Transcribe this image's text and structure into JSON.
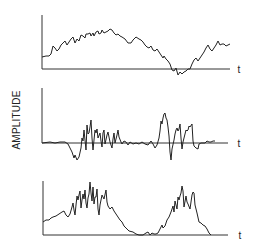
{
  "chart_data": [
    {
      "type": "line",
      "panel": 1,
      "title": "",
      "xlabel": "t",
      "ylabel": "AMPLITUDE",
      "grid": false,
      "description": "Raw signal: slowly varying noisy waveform, rises to a broad hump then dips below baseline and rises again before decaying",
      "frame": {
        "x0": 42,
        "y_top": 15,
        "y_base": 69,
        "x_end": 230
      },
      "points": [
        [
          42,
          57
        ],
        [
          46,
          56
        ],
        [
          49,
          56
        ],
        [
          51,
          54
        ],
        [
          53,
          46
        ],
        [
          55,
          48
        ],
        [
          57,
          51
        ],
        [
          59,
          49
        ],
        [
          61,
          45
        ],
        [
          63,
          43
        ],
        [
          65,
          41
        ],
        [
          67,
          45
        ],
        [
          69,
          42
        ],
        [
          71,
          39
        ],
        [
          73,
          37
        ],
        [
          75,
          43
        ],
        [
          77,
          39
        ],
        [
          79,
          41
        ],
        [
          81,
          35
        ],
        [
          83,
          36
        ],
        [
          85,
          38
        ],
        [
          86,
          34
        ],
        [
          88,
          34
        ],
        [
          90,
          33
        ],
        [
          91,
          36
        ],
        [
          93,
          33
        ],
        [
          94,
          36
        ],
        [
          96,
          32
        ],
        [
          98,
          31
        ],
        [
          99,
          34
        ],
        [
          101,
          33
        ],
        [
          102,
          30
        ],
        [
          104,
          33
        ],
        [
          106,
          32
        ],
        [
          108,
          31
        ],
        [
          110,
          29
        ],
        [
          112,
          30
        ],
        [
          114,
          33
        ],
        [
          116,
          35
        ],
        [
          118,
          34
        ],
        [
          120,
          36
        ],
        [
          122,
          37
        ],
        [
          125,
          39
        ],
        [
          128,
          43
        ],
        [
          131,
          43
        ],
        [
          133,
          40
        ],
        [
          136,
          37
        ],
        [
          139,
          39
        ],
        [
          141,
          40
        ],
        [
          143,
          42
        ],
        [
          145,
          45
        ],
        [
          147,
          47
        ],
        [
          149,
          48
        ],
        [
          151,
          46
        ],
        [
          153,
          50
        ],
        [
          155,
          51
        ],
        [
          157,
          49
        ],
        [
          159,
          52
        ],
        [
          161,
          55
        ],
        [
          163,
          58
        ],
        [
          164,
          56
        ],
        [
          166,
          59
        ],
        [
          168,
          61
        ],
        [
          170,
          64
        ],
        [
          172,
          70
        ],
        [
          174,
          71
        ],
        [
          176,
          68
        ],
        [
          178,
          75
        ],
        [
          180,
          72
        ],
        [
          182,
          74
        ],
        [
          184,
          72
        ],
        [
          186,
          71
        ],
        [
          188,
          69
        ],
        [
          190,
          69
        ],
        [
          192,
          64
        ],
        [
          194,
          60
        ],
        [
          196,
          58
        ],
        [
          198,
          61
        ],
        [
          200,
          58
        ],
        [
          202,
          55
        ],
        [
          204,
          52
        ],
        [
          206,
          48
        ],
        [
          208,
          45
        ],
        [
          210,
          49
        ],
        [
          212,
          51
        ],
        [
          214,
          48
        ],
        [
          216,
          45
        ],
        [
          218,
          41
        ],
        [
          220,
          45
        ],
        [
          222,
          44
        ],
        [
          224,
          44
        ],
        [
          226,
          46
        ],
        [
          228,
          45
        ],
        [
          230,
          44
        ]
      ],
      "t_label_pos": [
        239,
        69
      ]
    },
    {
      "type": "line",
      "panel": 2,
      "title": "",
      "xlabel": "t",
      "ylabel": "AMPLITUDE",
      "grid": false,
      "description": "Bipolar oscillating signal around zero baseline with two bursts of activity",
      "frame": {
        "x0": 42,
        "y_top": 88,
        "y_base": 143,
        "x_end": 228
      },
      "points": [
        [
          42,
          143
        ],
        [
          50,
          142
        ],
        [
          55,
          143
        ],
        [
          60,
          142
        ],
        [
          65,
          142
        ],
        [
          68,
          144
        ],
        [
          70,
          148
        ],
        [
          72,
          152
        ],
        [
          74,
          158
        ],
        [
          75,
          155
        ],
        [
          77,
          160
        ],
        [
          79,
          157
        ],
        [
          81,
          148
        ],
        [
          82,
          138
        ],
        [
          83,
          141
        ],
        [
          84,
          130
        ],
        [
          86,
          150
        ],
        [
          87,
          125
        ],
        [
          88,
          134
        ],
        [
          89,
          133
        ],
        [
          90,
          127
        ],
        [
          91,
          120
        ],
        [
          92,
          138
        ],
        [
          93,
          150
        ],
        [
          94,
          140
        ],
        [
          95,
          130
        ],
        [
          96,
          133
        ],
        [
          97,
          129
        ],
        [
          98,
          138
        ],
        [
          100,
          133
        ],
        [
          101,
          141
        ],
        [
          102,
          147
        ],
        [
          103,
          133
        ],
        [
          104,
          130
        ],
        [
          105,
          144
        ],
        [
          107,
          135
        ],
        [
          108,
          132
        ],
        [
          110,
          142
        ],
        [
          112,
          148
        ],
        [
          113,
          139
        ],
        [
          114,
          133
        ],
        [
          115,
          143
        ],
        [
          117,
          135
        ],
        [
          118,
          130
        ],
        [
          119,
          137
        ],
        [
          121,
          142
        ],
        [
          122,
          144
        ],
        [
          124,
          141
        ],
        [
          126,
          142
        ],
        [
          128,
          145
        ],
        [
          130,
          142
        ],
        [
          133,
          144
        ],
        [
          136,
          143
        ],
        [
          139,
          144
        ],
        [
          142,
          142
        ],
        [
          145,
          144
        ],
        [
          148,
          145
        ],
        [
          151,
          141
        ],
        [
          153,
          144
        ],
        [
          155,
          148
        ],
        [
          157,
          145
        ],
        [
          159,
          138
        ],
        [
          160,
          131
        ],
        [
          161,
          121
        ],
        [
          162,
          124
        ],
        [
          163,
          118
        ],
        [
          164,
          114
        ],
        [
          165,
          113
        ],
        [
          166,
          118
        ],
        [
          167,
          120
        ],
        [
          168,
          127
        ],
        [
          169,
          136
        ],
        [
          170,
          152
        ],
        [
          171,
          160
        ],
        [
          172,
          149
        ],
        [
          174,
          140
        ],
        [
          175,
          134
        ],
        [
          176,
          130
        ],
        [
          177,
          128
        ],
        [
          178,
          131
        ],
        [
          179,
          129
        ],
        [
          180,
          124
        ],
        [
          181,
          138
        ],
        [
          182,
          149
        ],
        [
          183,
          142
        ],
        [
          184,
          138
        ],
        [
          185,
          134
        ],
        [
          186,
          130
        ],
        [
          187,
          131
        ],
        [
          188,
          130
        ],
        [
          189,
          126
        ],
        [
          190,
          127
        ],
        [
          192,
          124
        ],
        [
          193,
          141
        ],
        [
          194,
          146
        ],
        [
          196,
          148
        ],
        [
          198,
          149
        ],
        [
          199,
          144
        ],
        [
          201,
          143
        ],
        [
          203,
          143
        ],
        [
          205,
          143
        ],
        [
          207,
          141
        ],
        [
          209,
          142
        ],
        [
          211,
          142
        ],
        [
          213,
          141
        ],
        [
          215,
          141
        ]
      ],
      "t_label_pos": [
        239,
        143
      ]
    },
    {
      "type": "line",
      "panel": 3,
      "title": "",
      "xlabel": "t",
      "ylabel": "AMPLITUDE",
      "grid": false,
      "description": "Rectified/envelope signal: always above baseline, two bursts of high amplitude",
      "frame": {
        "x0": 43,
        "y_top": 181,
        "y_base": 235,
        "x_end": 228
      },
      "points": [
        [
          43,
          222
        ],
        [
          46,
          220
        ],
        [
          49,
          220
        ],
        [
          51,
          218
        ],
        [
          53,
          217
        ],
        [
          56,
          216
        ],
        [
          59,
          214
        ],
        [
          62,
          212
        ],
        [
          64,
          211
        ],
        [
          66,
          215
        ],
        [
          68,
          217
        ],
        [
          70,
          214
        ],
        [
          72,
          207
        ],
        [
          73,
          203
        ],
        [
          74,
          210
        ],
        [
          75,
          215
        ],
        [
          76,
          205
        ],
        [
          77,
          196
        ],
        [
          78,
          200
        ],
        [
          79,
          195
        ],
        [
          80,
          191
        ],
        [
          81,
          208
        ],
        [
          82,
          200
        ],
        [
          83,
          194
        ],
        [
          84,
          199
        ],
        [
          85,
          190
        ],
        [
          86,
          203
        ],
        [
          87,
          208
        ],
        [
          88,
          198
        ],
        [
          89,
          194
        ],
        [
          90,
          182
        ],
        [
          91,
          193
        ],
        [
          92,
          201
        ],
        [
          93,
          187
        ],
        [
          94,
          204
        ],
        [
          95,
          197
        ],
        [
          96,
          197
        ],
        [
          97,
          189
        ],
        [
          98,
          209
        ],
        [
          99,
          215
        ],
        [
          100,
          205
        ],
        [
          102,
          195
        ],
        [
          104,
          199
        ],
        [
          106,
          190
        ],
        [
          107,
          202
        ],
        [
          108,
          206
        ],
        [
          110,
          209
        ],
        [
          112,
          207
        ],
        [
          114,
          211
        ],
        [
          116,
          214
        ],
        [
          118,
          217
        ],
        [
          120,
          220
        ],
        [
          122,
          222
        ],
        [
          124,
          226
        ],
        [
          126,
          228
        ],
        [
          129,
          231
        ],
        [
          133,
          232
        ],
        [
          136,
          234
        ],
        [
          139,
          235
        ],
        [
          143,
          235
        ],
        [
          146,
          233
        ],
        [
          148,
          232
        ],
        [
          150,
          235
        ],
        [
          152,
          233
        ],
        [
          154,
          234
        ],
        [
          156,
          234
        ],
        [
          158,
          233
        ],
        [
          160,
          229
        ],
        [
          162,
          225
        ],
        [
          163,
          228
        ],
        [
          165,
          226
        ],
        [
          167,
          220
        ],
        [
          169,
          217
        ],
        [
          171,
          212
        ],
        [
          173,
          206
        ],
        [
          174,
          212
        ],
        [
          175,
          201
        ],
        [
          177,
          209
        ],
        [
          178,
          197
        ],
        [
          179,
          200
        ],
        [
          180,
          196
        ],
        [
          181,
          193
        ],
        [
          182,
          186
        ],
        [
          183,
          191
        ],
        [
          184,
          207
        ],
        [
          186,
          196
        ],
        [
          187,
          202
        ],
        [
          188,
          204
        ],
        [
          190,
          209
        ],
        [
          192,
          195
        ],
        [
          193,
          192
        ],
        [
          194,
          193
        ],
        [
          195,
          205
        ],
        [
          197,
          213
        ],
        [
          199,
          222
        ],
        [
          201,
          223
        ],
        [
          203,
          225
        ],
        [
          205,
          226
        ],
        [
          207,
          229
        ],
        [
          209,
          233
        ],
        [
          211,
          235
        ]
      ],
      "t_label_pos": [
        240,
        235
      ]
    }
  ],
  "labels": {
    "ylabel": "AMPLITUDE",
    "t1": "t",
    "t2": "t",
    "t3": "t"
  }
}
